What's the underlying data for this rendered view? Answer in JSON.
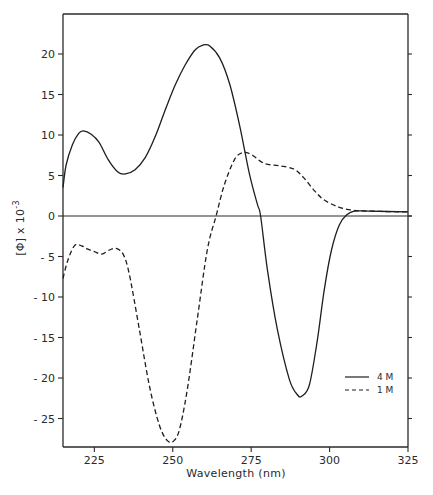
{
  "chart_data": {
    "type": "line",
    "title": "",
    "xlabel": "Wavelength (nm)",
    "ylabel": "[Φ] x 10⁻³",
    "xlim": [
      215,
      325
    ],
    "ylim": [
      -28,
      25
    ],
    "grid": false,
    "legend_position": "lower right",
    "x_ticks": [
      225,
      250,
      275,
      300,
      325
    ],
    "y_ticks": [
      -25,
      -20,
      -15,
      -10,
      -5,
      0,
      5,
      10,
      15,
      20
    ],
    "series": [
      {
        "name": "4 M",
        "style": "solid",
        "x": [
          215,
          216,
          218,
          220,
          221.5,
          224,
          226.5,
          229.5,
          232.6,
          234.9,
          238,
          241.2,
          244.4,
          247.6,
          250.8,
          253.9,
          257.1,
          259.6,
          261.8,
          265,
          268.2,
          271.3,
          274.5,
          277,
          278,
          280.2,
          283.4,
          287.2,
          289.8,
          291.3,
          293.6,
          296.1,
          298.3,
          300.6,
          303.1,
          305.6,
          307.9,
          312.7,
          325
        ],
        "values": [
          3.5,
          6.3,
          8.8,
          10.2,
          10.5,
          10.1,
          9.1,
          6.9,
          5.4,
          5.2,
          5.7,
          7.2,
          9.8,
          13.1,
          16.2,
          18.6,
          20.5,
          21.1,
          21.0,
          19.5,
          16.2,
          11.2,
          5.1,
          1.4,
          0,
          -6.7,
          -14.1,
          -20.2,
          -22.1,
          -22.2,
          -20.8,
          -15.3,
          -9.1,
          -4.2,
          -1.1,
          0.2,
          0.6,
          0.6,
          0.5
        ]
      },
      {
        "name": "1 M",
        "style": "dashed",
        "x": [
          215,
          216.6,
          218.8,
          221,
          222.9,
          225,
          227.3,
          229.8,
          232,
          234.3,
          236.2,
          239.4,
          242.5,
          245.7,
          248.2,
          250.2,
          252.1,
          254.6,
          257.8,
          261,
          263.8,
          266.4,
          269.6,
          272.1,
          275,
          279.1,
          283.9,
          288.6,
          291.8,
          295,
          298.2,
          302.9,
          307.6,
          312.4,
          325
        ],
        "values": [
          -7.7,
          -5.4,
          -3.6,
          -3.7,
          -4.1,
          -4.4,
          -4.7,
          -4.2,
          -4.0,
          -4.8,
          -7.3,
          -14.1,
          -20.9,
          -25.8,
          -27.7,
          -27.8,
          -26.4,
          -21.5,
          -12.8,
          -4.2,
          0,
          3.8,
          6.9,
          7.8,
          7.6,
          6.5,
          6.2,
          5.8,
          4.7,
          3.2,
          2.0,
          1.1,
          0.7,
          0.6,
          0.5
        ]
      }
    ]
  },
  "axes": {
    "x_title": "Wavelength (nm)",
    "y_title_main": "[Φ] x 10",
    "y_title_exp": "-3",
    "x_tick_labels": [
      "225",
      "250",
      "275",
      "300",
      "325"
    ],
    "y_tick_labels": [
      "20",
      "15",
      "10",
      "5",
      "0",
      "-5",
      "-10",
      "-15",
      "-20",
      "-25"
    ]
  },
  "legend": {
    "items": [
      {
        "label": "4 M",
        "style": "solid"
      },
      {
        "label": "1 M",
        "style": "dashed"
      }
    ]
  },
  "colors": {
    "line": "#1e1e1e",
    "axis": "#2a2a2a",
    "background": "#ffffff"
  }
}
